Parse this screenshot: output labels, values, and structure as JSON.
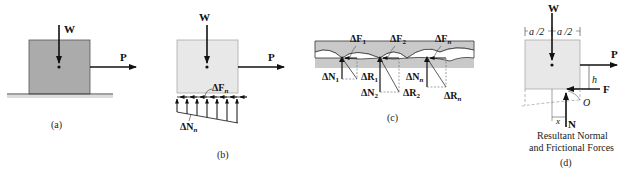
{
  "figure": {
    "panels": [
      {
        "id": "a",
        "caption": "(a)",
        "labels": {
          "weight": "W",
          "push": "P"
        }
      },
      {
        "id": "b",
        "caption": "(b)",
        "labels": {
          "weight": "W",
          "push": "P",
          "friction": "ΔF",
          "friction_sub": "n",
          "normal": "ΔN",
          "normal_sub": "n"
        }
      },
      {
        "id": "c",
        "caption": "(c)",
        "contacts": [
          {
            "F": "ΔF",
            "F_sub": "1",
            "N": "ΔN",
            "N_sub": "1",
            "R": "ΔR",
            "R_sub": "1"
          },
          {
            "F": "ΔF",
            "F_sub": "2",
            "N": "ΔN",
            "N_sub": "2",
            "R": "ΔR",
            "R_sub": "2"
          },
          {
            "F": "ΔF",
            "F_sub": "n",
            "N": "ΔN",
            "N_sub": "n",
            "R": "ΔR",
            "R_sub": "n"
          }
        ]
      },
      {
        "id": "d",
        "caption": "(d)",
        "labels": {
          "weight": "W",
          "push": "P",
          "friction": "F",
          "normal": "N",
          "half_width_left": "a /2",
          "half_width_right": "a /2",
          "height": "h",
          "point": "O",
          "offset": "x"
        },
        "note_line1": "Resultant Normal",
        "note_line2": "and Frictional Forces"
      }
    ]
  },
  "colors": {
    "block_dark": "#ababab",
    "block_light": "#e8e8e8",
    "band": "#c9c9c9",
    "ink": "#111111"
  }
}
